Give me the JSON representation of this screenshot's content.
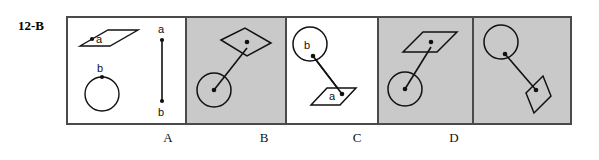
{
  "item": {
    "number_label": "12-B",
    "type": "spatial-reasoning-multiple-choice"
  },
  "stimulus_panel": {
    "name": "stimulus",
    "background": "#ffffff",
    "shapes": [
      {
        "kind": "parallelogram",
        "label": "a",
        "dot_label": "a",
        "note": "parallelogram with marked point labeled a near its left-inside corner"
      },
      {
        "kind": "circle",
        "label": "b",
        "dot_label": "b",
        "note": "circle with marked point labeled b at its top"
      },
      {
        "kind": "connector-segment",
        "endpoint_top_label": "a",
        "endpoint_bottom_label": "b",
        "note": "vertical line segment with dots at both ends; top end labeled a, bottom end labeled b"
      }
    ]
  },
  "options": [
    {
      "letter": "A",
      "background": "#c9c9c9",
      "description": "circle lower-left joined by a segment to a parallelogram upper-right; attachment dot inside parallelogram"
    },
    {
      "letter": "B",
      "background": "#ffffff",
      "description": "circle upper-left labeled b joined to a parallelogram lower-right labeled a",
      "labels": [
        "b",
        "a"
      ]
    },
    {
      "letter": "C",
      "background": "#c9c9c9",
      "description": "circle lower-left joined by a short segment to a parallelogram upper-right"
    },
    {
      "letter": "D",
      "background": "#c9c9c9",
      "description": "circle upper-left joined by a long segment to a tilted parallelogram lower-right"
    }
  ],
  "colors": {
    "frame_border": "#4a4a4a",
    "shaded_panel": "#c9c9c9",
    "plain_panel": "#ffffff",
    "ink": "#111111",
    "page_background": "#ffffff"
  }
}
